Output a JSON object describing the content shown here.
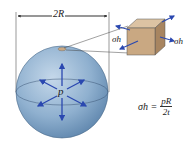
{
  "diagram": {
    "dimension_label": "2R",
    "pressure_label": "p",
    "stress_label_left": "σh",
    "stress_label_right": "σh",
    "formula": {
      "lhs": "σh =",
      "numerator": "pR",
      "denominator": "2t"
    },
    "colors": {
      "sphere": "#8fb0cf",
      "arrows": "#2a48b0",
      "cube": "#c9a882",
      "lines": "#444444"
    }
  }
}
